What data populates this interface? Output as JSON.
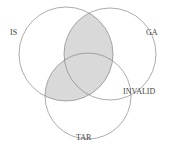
{
  "diagram": {
    "type": "venn",
    "sets": [
      {
        "name": "IS",
        "cx": 66,
        "cy": 54,
        "r": 47
      },
      {
        "name": "GA",
        "cx": 110,
        "cy": 54,
        "r": 46
      },
      {
        "name": "TAR",
        "cx": 88,
        "cy": 96,
        "r": 43
      }
    ],
    "shaded_regions": [
      "IS∩GA",
      "IS∩TAR"
    ],
    "shade_color": "#d9d9d9",
    "stroke_color": "#888888",
    "labels": {
      "is": "IS",
      "ga": "GA",
      "invalid": "INVALID",
      "tar": "TAR"
    }
  }
}
